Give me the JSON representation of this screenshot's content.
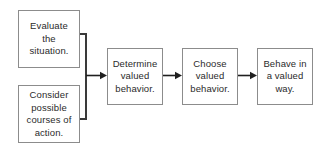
{
  "diagram": {
    "type": "flowchart",
    "orientation": "left-to-right",
    "background_color": "#ffffff",
    "box_border_color": "#8c8c8c",
    "connector_color": "#3a3a3a",
    "text_color": "#2b2b2b",
    "nodes": [
      {
        "id": "evaluate",
        "label": "Evaluate\nthe\nsituation.",
        "column": "left",
        "row": "top"
      },
      {
        "id": "consider",
        "label": "Consider\npossible\ncourses of\naction.",
        "column": "left",
        "row": "bottom"
      },
      {
        "id": "determine",
        "label": "Determine\nvalued\nbehavior.",
        "column": "chain",
        "order": 1
      },
      {
        "id": "choose",
        "label": "Choose\nvalued\nbehavior.",
        "column": "chain",
        "order": 2
      },
      {
        "id": "behave",
        "label": "Behave in\na valued\nway.",
        "column": "chain",
        "order": 3
      }
    ],
    "edges": [
      {
        "id": "merge-to-determine",
        "from": [
          "evaluate",
          "consider"
        ],
        "to": "determine",
        "style": "bracket-merge-arrow"
      },
      {
        "id": "determine-to-choose",
        "from": "determine",
        "to": "choose",
        "style": "arrow"
      },
      {
        "id": "choose-to-behave",
        "from": "choose",
        "to": "behave",
        "style": "arrow"
      }
    ]
  }
}
